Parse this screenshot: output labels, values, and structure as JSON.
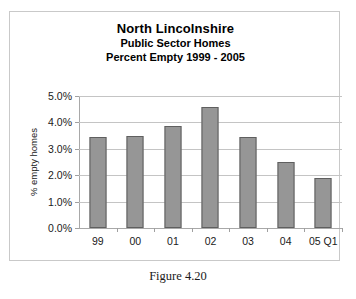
{
  "figure": {
    "caption": "Figure 4.20"
  },
  "chart_data": {
    "type": "bar",
    "title": "North Lincolnshire",
    "subtitle_1": "Public Sector Homes",
    "subtitle_2": "Percent Empty 1999 - 2005",
    "xlabel": "",
    "ylabel": "% empty homes",
    "categories": [
      "99",
      "00",
      "01",
      "02",
      "03",
      "04",
      "05 Q1"
    ],
    "values": [
      3.45,
      3.47,
      3.88,
      4.58,
      3.45,
      2.5,
      1.88
    ],
    "value_labels": [
      "3.45%",
      "3.47%",
      "3.88%",
      "4.58%",
      "3.45%",
      "2.50%",
      "1.88%"
    ],
    "ylim": [
      0,
      5
    ],
    "ytick_values": [
      0,
      1,
      2,
      3,
      4,
      5
    ],
    "ytick_labels": [
      "0.0%",
      "1.0%",
      "2.0%",
      "3.0%",
      "4.0%",
      "5.0%"
    ],
    "grid": true,
    "legend": false,
    "bar_color": "#969696",
    "bar_border_color": "#5f5f5f",
    "gridline_color": "#c4c4c4",
    "axis_color": "#a8a8a8"
  }
}
